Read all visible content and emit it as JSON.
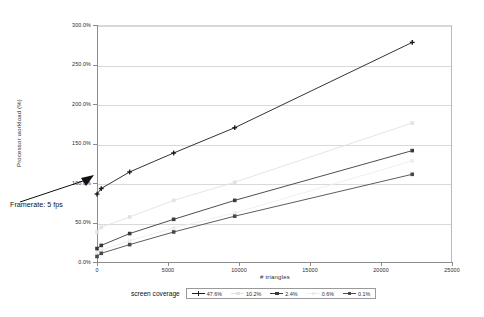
{
  "chart_data": {
    "type": "line",
    "title": "",
    "xlabel": "# triangles",
    "ylabel": "Processor workload (%)",
    "xlim": [
      0,
      25000
    ],
    "ylim": [
      0,
      300
    ],
    "xticks": [
      "0",
      "5000",
      "10000",
      "15000",
      "20000",
      "25000"
    ],
    "xtick_values": [
      0,
      5000,
      10000,
      15000,
      20000,
      25000
    ],
    "yticks": [
      "0.0%",
      "50.0%",
      "100.0%",
      "150.0%",
      "200.0%",
      "250.0%",
      "300.0%"
    ],
    "ytick_values": [
      0,
      50,
      100,
      150,
      200,
      250,
      300
    ],
    "grid": true,
    "legend_title": "screen coverage",
    "legend_position": "bottom",
    "x": [
      0,
      300,
      2300,
      5400,
      9700,
      22200
    ],
    "series": [
      {
        "name": "47.6%",
        "color": "#1c1c1c",
        "marker": "plus",
        "values": [
          86,
          93,
          114,
          138,
          170,
          278
        ]
      },
      {
        "name": "10.2%",
        "color": "#e2e2e2",
        "marker": "square",
        "values": [
          38,
          44,
          57,
          78,
          101,
          176
        ]
      },
      {
        "name": "2.4%",
        "color": "#3a3a3a",
        "marker": "square",
        "values": [
          17,
          21,
          36,
          54,
          78,
          141
        ]
      },
      {
        "name": "0.6%",
        "color": "#ededed",
        "marker": "square",
        "values": [
          12,
          15,
          27,
          43,
          62,
          128
        ]
      },
      {
        "name": "0.1%",
        "color": "#4a4a4a",
        "marker": "square",
        "values": [
          7,
          11,
          22,
          38,
          58,
          111
        ]
      }
    ],
    "annotations": [
      {
        "text": "Framerate: 5 fps",
        "target_x": 0,
        "target_y": 100
      }
    ]
  }
}
